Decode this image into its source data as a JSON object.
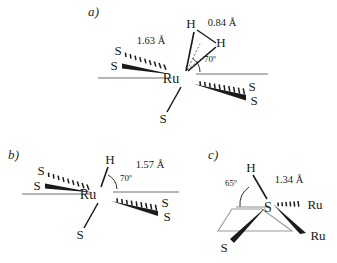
{
  "figure": {
    "background_color": "#ffffff",
    "line_color": "#1a1a1a",
    "plane_color": "#8a8a8a"
  },
  "panels": [
    {
      "id": "a",
      "label": "a)",
      "center_atom": "Ru",
      "description": "Ruthenium dihydrogen complex with five sulfur ligands",
      "hydrogens": [
        {
          "label": "H",
          "position": "upper-left"
        },
        {
          "label": "H",
          "position": "upper-right"
        }
      ],
      "sulfurs": [
        {
          "label": "S",
          "position": "left-upper",
          "bond": "hashed-wedge"
        },
        {
          "label": "S",
          "position": "left-lower",
          "bond": "solid-wedge"
        },
        {
          "label": "S",
          "position": "right-upper",
          "bond": "hashed-wedge"
        },
        {
          "label": "S",
          "position": "right-lower",
          "bond": "solid-wedge"
        },
        {
          "label": "S",
          "position": "bottom",
          "bond": "plain-line"
        }
      ],
      "measurements": [
        {
          "name": "ru-h-distance",
          "value": "1.63 Å"
        },
        {
          "name": "h-h-distance",
          "value": "0.84 Å"
        }
      ],
      "angles": [
        {
          "name": "h-ru-plane-angle",
          "value": "70º"
        }
      ]
    },
    {
      "id": "b",
      "label": "b)",
      "center_atom": "Ru",
      "description": "Ruthenium hydride complex with five sulfur ligands",
      "hydrogens": [
        {
          "label": "H",
          "position": "top"
        }
      ],
      "sulfurs": [
        {
          "label": "S",
          "position": "left-upper",
          "bond": "hashed-wedge"
        },
        {
          "label": "S",
          "position": "left-lower",
          "bond": "solid-wedge"
        },
        {
          "label": "S",
          "position": "right-upper",
          "bond": "hashed-wedge"
        },
        {
          "label": "S",
          "position": "right-lower",
          "bond": "solid-wedge"
        },
        {
          "label": "S",
          "position": "bottom",
          "bond": "plain-line"
        }
      ],
      "measurements": [
        {
          "name": "ru-h-distance",
          "value": "1.57 Å"
        }
      ],
      "angles": [
        {
          "name": "h-ru-plane-angle",
          "value": "70º"
        }
      ]
    },
    {
      "id": "c",
      "label": "c)",
      "center_atom": "S",
      "description": "Bridging thiol sulfur bonded to two ruthenium atoms and one sulfur",
      "hydrogens": [
        {
          "label": "H",
          "position": "top"
        }
      ],
      "rutheniums": [
        {
          "label": "Ru",
          "position": "right-upper",
          "bond": "hashed-wedge"
        },
        {
          "label": "Ru",
          "position": "right-lower",
          "bond": "solid-wedge"
        }
      ],
      "sulfurs": [
        {
          "label": "S",
          "position": "lower-left",
          "bond": "solid-wedge"
        }
      ],
      "measurements": [
        {
          "name": "s-h-distance",
          "value": "1.34 Å"
        }
      ],
      "angles": [
        {
          "name": "h-s-plane-angle",
          "value": "65º"
        }
      ]
    }
  ]
}
